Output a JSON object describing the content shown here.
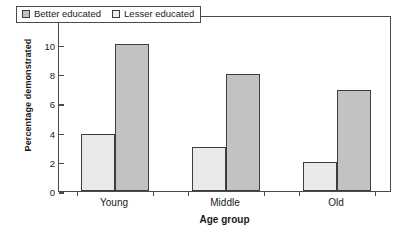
{
  "chart_data": {
    "type": "bar",
    "title": "",
    "subtitle": "",
    "xlabel": "Age group",
    "ylabel": "Percentage demonstrated",
    "categories": [
      "Young",
      "Middle",
      "Old"
    ],
    "series": [
      {
        "name": "Better educated",
        "values": [
          3.9,
          3.0,
          2.0
        ],
        "color": "#e9e9e9"
      },
      {
        "name": "Lesser educated",
        "values": [
          10.0,
          8.0,
          6.9
        ],
        "color": "#c2c2c2"
      }
    ],
    "ylim": [
      0,
      12
    ],
    "yticks": [
      0,
      2,
      4,
      6,
      8,
      10,
      12
    ],
    "ytick_labels": [
      "0",
      "2",
      "4",
      "6",
      "8",
      "10",
      "12"
    ],
    "grid": false,
    "legend_position": "upper-left-inside",
    "frame": true,
    "bar_edge_color": "#3d3d3d",
    "axis_color": "#4a4a4a",
    "background": "#ffffff"
  },
  "legend": {
    "entries": [
      {
        "label": "Better educated",
        "swatch_color": "#c2c2c2"
      },
      {
        "label": "Lesser educated",
        "swatch_color": "#ededed"
      }
    ]
  }
}
